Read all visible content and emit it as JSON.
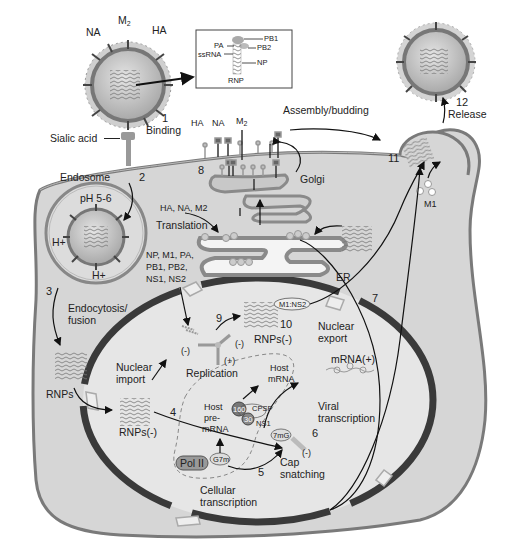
{
  "virion_labels": {
    "na": "NA",
    "m2": "M",
    "m2_sub": "2",
    "ha": "HA"
  },
  "rnp_inset": {
    "pb1": "PB1",
    "pa": "PA",
    "pb2": "PB2",
    "ssrna": "ssRNA",
    "np": "NP",
    "title": "RNP"
  },
  "membrane_labels": {
    "ha": "HA",
    "na": "NA",
    "m2": "M",
    "m2_sub": "2"
  },
  "steps": {
    "s1": {
      "num": "1",
      "label": "Binding"
    },
    "s2": {
      "num": "2"
    },
    "s3": {
      "num": "3",
      "label": "Endocytosis/ fusion",
      "line1": "Endocytosis/",
      "line2": "fusion"
    },
    "s4": {
      "num": "4"
    },
    "s5": {
      "num": "5"
    },
    "s6": {
      "num": "6"
    },
    "s7": {
      "num": "7"
    },
    "s8": {
      "num": "8"
    },
    "s9": {
      "num": "9"
    },
    "s10": {
      "num": "10"
    },
    "s11": {
      "num": "11"
    },
    "s12": {
      "num": "12",
      "label": "Release"
    }
  },
  "labels": {
    "sialic_acid": "Sialic acid",
    "endosome": "Endosome",
    "ph": "pH 5-6",
    "h_plus": "H+",
    "assembly": "Assembly/budding",
    "golgi": "Golgi",
    "er": "ER",
    "translation_proteins": "HA, NA, M2",
    "translation": "Translation",
    "np_line1": "NP, M1, PA,",
    "np_line2": "PB1, PB2,",
    "np_line3": "NS1, NS2",
    "rnps": "RNPs",
    "nuclear_import_1": "Nuclear",
    "nuclear_import_2": "import",
    "rnps_minus_1": "RNPs(-)",
    "rnps_minus_2": "RNPs(-)",
    "replication": "Replication",
    "minus": "(-)",
    "plus": "(+)",
    "m1ns2": "M1:NS2",
    "nuclear_export_1": "Nuclear",
    "nuclear_export_2": "export",
    "mrna_plus": "mRNA(+)",
    "host_mrna_1": "Host",
    "host_mrna_2": "mRNA",
    "host_pre_1": "Host",
    "host_pre_2": "pre-",
    "host_pre_3": "mRNA",
    "cpsf160": "160",
    "cpsf": "CPSF",
    "ns1_30": "30",
    "ns1": "NS1",
    "viral_transcription_1": "Viral",
    "viral_transcription_2": "transcription",
    "m7g": "7mG",
    "g7m": "G7m",
    "pol2": "Pol II",
    "cap_1": "Cap",
    "cap_2": "snatching",
    "cellular_1": "Cellular",
    "cellular_2": "transcription",
    "m1": "M1"
  }
}
